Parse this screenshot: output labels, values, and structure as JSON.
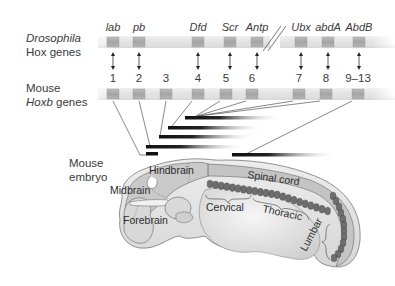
{
  "labels": {
    "drosophila_line1": "Drosophila",
    "drosophila_line2": "Hox genes",
    "mouse_line1": "Mouse",
    "mouse_line2_italic": "Hoxb",
    "mouse_line2_rest": " genes",
    "embryo_line1": "Mouse",
    "embryo_line2": "embryo"
  },
  "drosophila_genes": [
    {
      "name": "lab",
      "x": 113
    },
    {
      "name": "pb",
      "x": 139
    },
    {
      "name": "Dfd",
      "x": 198
    },
    {
      "name": "Scr",
      "x": 230
    },
    {
      "name": "Antp",
      "x": 257
    },
    {
      "name": "Ubx",
      "x": 301
    },
    {
      "name": "abdA",
      "x": 328
    },
    {
      "name": "AbdB",
      "x": 359
    }
  ],
  "mouse_genes": [
    {
      "name": "1",
      "x": 113
    },
    {
      "name": "2",
      "x": 139
    },
    {
      "name": "3",
      "x": 166
    },
    {
      "name": "4",
      "x": 198
    },
    {
      "name": "5",
      "x": 226
    },
    {
      "name": "6",
      "x": 252
    },
    {
      "name": "7",
      "x": 299
    },
    {
      "name": "8",
      "x": 326
    },
    {
      "name": "9–13",
      "x": 358
    }
  ],
  "homology_arrows": [
    {
      "from": "lab",
      "to": "1"
    },
    {
      "from": "pb",
      "to": "2"
    },
    {
      "from": "Dfd",
      "to": "4"
    },
    {
      "from": "Scr",
      "to": "5"
    },
    {
      "from": "Antp",
      "to": "6"
    },
    {
      "from": "Ubx",
      "to": "7"
    },
    {
      "from": "abdA",
      "to": "8"
    },
    {
      "from": "AbdB",
      "to": "9–13"
    }
  ],
  "expression_bars": [
    {
      "gene": "1",
      "x1": 146,
      "x2": 158,
      "y": 154
    },
    {
      "gene": "2",
      "x1": 146,
      "x2": 240,
      "y": 147
    },
    {
      "gene": "3",
      "x1": 159,
      "x2": 252,
      "y": 137
    },
    {
      "gene": "4",
      "x1": 168,
      "x2": 262,
      "y": 127
    },
    {
      "gene": "5–8",
      "x1": 185,
      "x2": 282,
      "y": 117
    },
    {
      "gene": "9–13",
      "x1": 232,
      "x2": 338,
      "y": 155
    }
  ],
  "embryo_regions": {
    "hindbrain": "Hindbrain",
    "midbrain": "Midbrain",
    "forebrain": "Forebrain",
    "spinal_cord": "Spinal cord",
    "cervical": "Cervical",
    "thoracic": "Thoracic",
    "lumbar": "Lumbar"
  },
  "colors": {
    "bar": "#e4e4e4",
    "box": "#a9a9a9",
    "embryo_fill": "#d2d2d2",
    "embryo_light": "#e8e8e8",
    "somite": "#6e6e6e",
    "text": "#3a3a3a",
    "line": "#555555"
  }
}
